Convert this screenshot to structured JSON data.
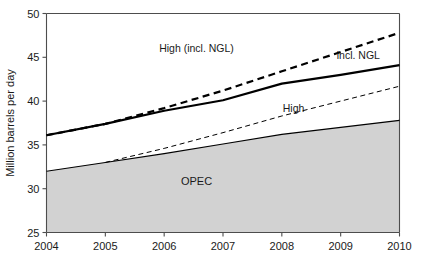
{
  "chart_data": {
    "type": "line",
    "title": "",
    "subtitle": "",
    "xlabel": "",
    "ylabel": "Million barrels per day",
    "xlim": [
      2004,
      2010
    ],
    "ylim": [
      25,
      50
    ],
    "grid": false,
    "legend_position": "inline-annotations",
    "x": [
      2004,
      2005,
      2006,
      2007,
      2008,
      2009,
      2010
    ],
    "xtick_labels": [
      "2004",
      "2005",
      "2006",
      "2007",
      "2008",
      "2009",
      "2010"
    ],
    "ytick_labels": [
      "25",
      "30",
      "35",
      "40",
      "45",
      "50"
    ],
    "ytick_values": [
      25,
      30,
      35,
      40,
      45,
      50
    ],
    "series": [
      {
        "name": "OPEC",
        "label": "OPEC",
        "style": "filled-area",
        "color": "#d2d2d2",
        "edge_color": "#000000",
        "x": [
          2004,
          2005,
          2006,
          2007,
          2008,
          2009,
          2010
        ],
        "values": [
          32.0,
          33.0,
          34.0,
          35.1,
          36.2,
          37.0,
          37.8
        ]
      },
      {
        "name": "incl. NGL",
        "label": "incl. NGL",
        "style": "solid-thick",
        "color": "#000000",
        "x": [
          2004,
          2005,
          2006,
          2007,
          2008,
          2009,
          2010
        ],
        "values": [
          36.1,
          37.4,
          38.9,
          40.1,
          42.0,
          43.0,
          44.1
        ]
      },
      {
        "name": "High (incl. NGL)",
        "label": "High (incl. NGL)",
        "style": "dashed-thick",
        "color": "#000000",
        "x": [
          2004,
          2005,
          2006,
          2007,
          2008,
          2009,
          2010
        ],
        "values": [
          36.1,
          37.4,
          39.2,
          41.2,
          43.4,
          45.6,
          47.8
        ]
      },
      {
        "name": "High",
        "label": "High",
        "style": "dashed-thin",
        "color": "#000000",
        "x": [
          2005,
          2006,
          2007,
          2008,
          2009,
          2010
        ],
        "values": [
          33.0,
          34.6,
          36.4,
          38.3,
          40.0,
          41.7
        ]
      }
    ],
    "annotations": [
      {
        "text": "High (incl. NGL)",
        "x": 2006.55,
        "y": 45.55,
        "anchor": "middle"
      },
      {
        "text": "incl. NGL",
        "x": 2009.3,
        "y": 44.8,
        "anchor": "middle"
      },
      {
        "text": "High",
        "x": 2008.2,
        "y": 38.75,
        "anchor": "middle"
      },
      {
        "text": "OPEC",
        "x": 2006.55,
        "y": 30.4,
        "anchor": "middle"
      }
    ]
  },
  "axes": {
    "y_title": "Million barrels per day"
  },
  "colors": {
    "line": "#000000",
    "area_fill": "#d2d2d2",
    "axis": "#4d4d4d",
    "background": "#ffffff"
  }
}
